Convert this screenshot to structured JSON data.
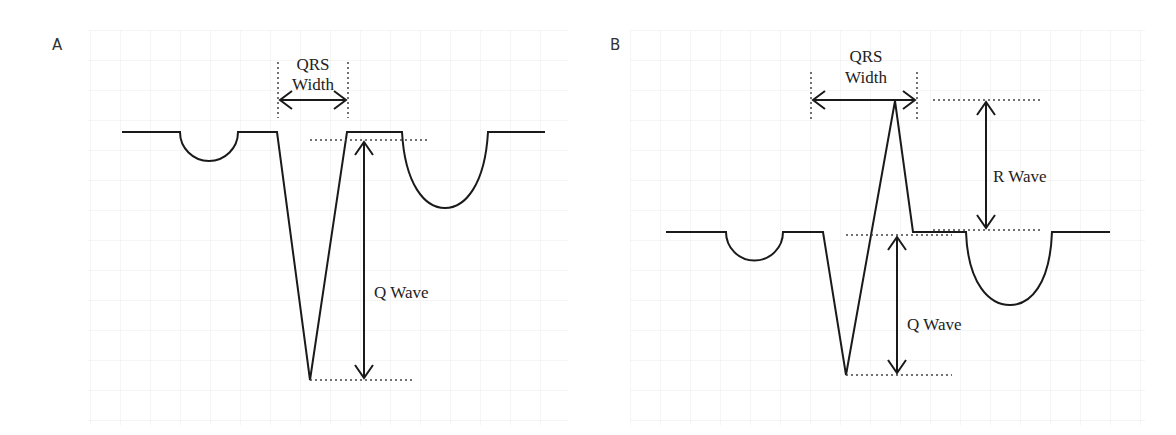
{
  "panels": [
    {
      "id": "A",
      "label": "A",
      "annotations": {
        "qrs_width_line1": "QRS",
        "qrs_width_line2": "Width",
        "q_wave": "Q Wave"
      }
    },
    {
      "id": "B",
      "label": "B",
      "annotations": {
        "qrs_width_line1": "QRS",
        "qrs_width_line2": "Width",
        "r_wave": "R Wave",
        "q_wave": "Q Wave"
      }
    }
  ],
  "colors": {
    "trace": "#1a1a1a",
    "grid": "#ececec",
    "background": "#ffffff"
  }
}
